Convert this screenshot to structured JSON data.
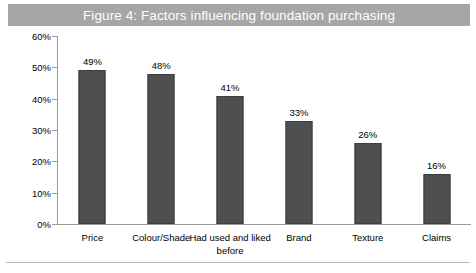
{
  "figure": {
    "title": "Figure 4: Factors influencing foundation purchasing",
    "title_band_color": "#a6a6a6",
    "title_text_color": "#ffffff"
  },
  "chart_data": {
    "type": "bar",
    "title": "Figure 4: Factors influencing foundation purchasing",
    "categories": [
      "Price",
      "Colour/Shade",
      "Had used and liked before",
      "Brand",
      "Texture",
      "Claims"
    ],
    "values": [
      49,
      48,
      41,
      33,
      26,
      16
    ],
    "value_labels": [
      "49%",
      "48%",
      "41%",
      "33%",
      "26%",
      "16%"
    ],
    "xlabel": "",
    "ylabel": "",
    "ylim": [
      0,
      60
    ],
    "ytick_labels": [
      "0%",
      "10%",
      "20%",
      "30%",
      "40%",
      "50%",
      "60%"
    ],
    "ytick_values": [
      0,
      10,
      20,
      30,
      40,
      50,
      60
    ],
    "grid": false,
    "legend": false,
    "bar_color": "#4f4f4f",
    "bar_edge_color": "#3d3d3d",
    "axis_color": "#9a9a9a",
    "background_color": "#ffffff"
  }
}
